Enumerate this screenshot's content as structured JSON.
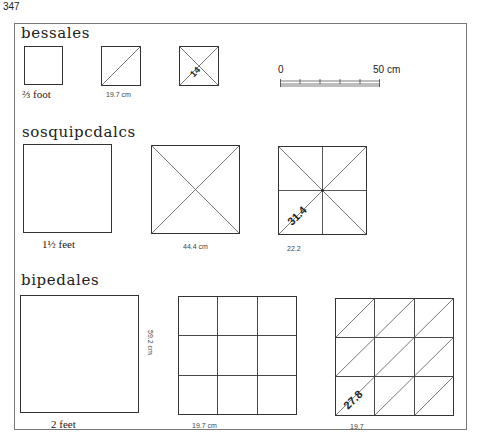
{
  "page_number": "347",
  "scale_bar": {
    "start_label": "0",
    "end_label": "50 cm"
  },
  "sections": [
    {
      "title": "bessales",
      "items": [
        {
          "caption": "⅔ foot",
          "pattern": "plain"
        },
        {
          "caption": "19.7 cm",
          "pattern": "single-diagonal"
        },
        {
          "caption": "",
          "pattern": "cross-diagonals",
          "inner_label": "14"
        }
      ]
    },
    {
      "title": "sosquipcdalcs",
      "items": [
        {
          "caption": "1½ feet",
          "pattern": "plain"
        },
        {
          "caption": "44.4 cm",
          "pattern": "cross-diagonals"
        },
        {
          "caption": "22.2",
          "pattern": "quartered-with-diagonals",
          "inner_label": "31.4"
        }
      ]
    },
    {
      "title": "bipedales",
      "items": [
        {
          "caption": "2 feet",
          "side_label": "59.2 cm",
          "pattern": "plain"
        },
        {
          "caption": "19.7 cm",
          "pattern": "3x3-grid"
        },
        {
          "caption": "19.7",
          "pattern": "3x3-grid-diagonals",
          "inner_label": "27.8"
        }
      ]
    }
  ]
}
